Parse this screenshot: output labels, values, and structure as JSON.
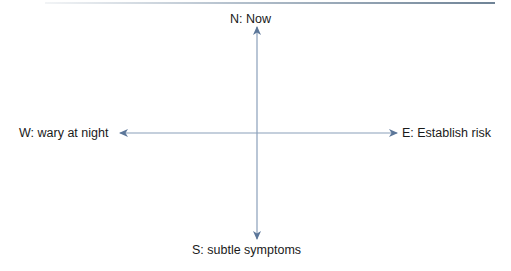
{
  "diagram": {
    "type": "compass-quadrant",
    "colors": {
      "axis": "#6f87a6",
      "arrowhead": "#5b7699",
      "text": "#1a1a1a"
    },
    "labels": {
      "north": "N: Now",
      "west": "W: wary at night",
      "east": "E: Establish risk",
      "south": "S: subtle symptoms"
    }
  }
}
